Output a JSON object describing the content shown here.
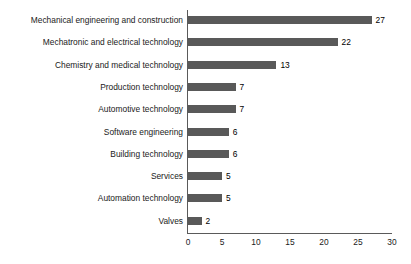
{
  "chart_data": {
    "type": "bar",
    "orientation": "horizontal",
    "title": "",
    "subtitle": "",
    "xlabel": "",
    "ylabel": "",
    "xlim": [
      0,
      30
    ],
    "x_ticks": [
      0,
      5,
      10,
      15,
      20,
      25,
      30
    ],
    "x_tick_labels": [
      "0",
      "5",
      "10",
      "15",
      "20",
      "25",
      "30"
    ],
    "grid": false,
    "legend": false,
    "legend_position": "none",
    "bar_color": "#595959",
    "axis_color": "#5a5a5a",
    "text_color": "#1a1a1a",
    "background": "#ffffff",
    "categories": [
      "Mechanical engineering and construction",
      "Mechatronic and electrical technology",
      "Chemistry and medical technology",
      "Production technology",
      "Automotive technology",
      "Software engineering",
      "Building technology",
      "Services",
      "Automation technology",
      "Valves"
    ],
    "values": [
      27,
      22,
      13,
      7,
      7,
      6,
      6,
      5,
      5,
      2
    ],
    "value_labels": [
      "27",
      "22",
      "13",
      "7",
      "7",
      "6",
      "6",
      "5",
      "5",
      "2"
    ]
  }
}
